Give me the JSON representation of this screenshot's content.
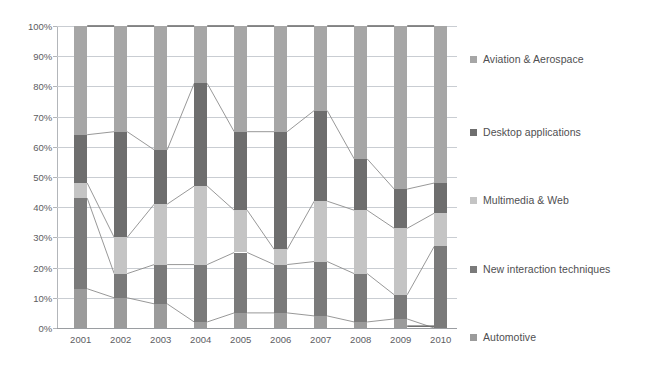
{
  "chart_data": {
    "type": "bar",
    "stacked": true,
    "normalized": true,
    "title": "",
    "xlabel": "",
    "ylabel": "",
    "ylim": [
      0,
      100
    ],
    "grid": true,
    "legend_position": "right",
    "categories": [
      "2001",
      "2002",
      "2003",
      "2004",
      "2005",
      "2006",
      "2007",
      "2008",
      "2009",
      "2010"
    ],
    "ytick_labels": [
      "0%",
      "10%",
      "20%",
      "30%",
      "40%",
      "50%",
      "60%",
      "70%",
      "80%",
      "90%",
      "100%"
    ],
    "ytick_values": [
      0,
      10,
      20,
      30,
      40,
      50,
      60,
      70,
      80,
      90,
      100
    ],
    "series": [
      {
        "name": "Automotive",
        "color": "#9b9b9b",
        "values": [
          13,
          10,
          8,
          2,
          5,
          5,
          4,
          2,
          3,
          0
        ]
      },
      {
        "name": "New interaction techniques",
        "color": "#7a7a7a",
        "values": [
          30,
          8,
          13,
          19,
          20,
          16,
          18,
          16,
          8,
          27
        ]
      },
      {
        "name": "Multimedia & Web",
        "color": "#c4c4c4",
        "values": [
          5,
          12,
          20,
          26,
          14,
          5,
          20,
          21,
          22,
          11
        ]
      },
      {
        "name": "Desktop applications",
        "color": "#6e6e6e",
        "values": [
          16,
          35,
          18,
          34,
          26,
          39,
          30,
          17,
          13,
          10
        ]
      },
      {
        "name": "Aviation & Aerospace",
        "color": "#a6a6a6",
        "values": [
          36,
          35,
          41,
          19,
          35,
          35,
          28,
          44,
          54,
          52
        ]
      }
    ],
    "cumulative_tops": {
      "2001": [
        13,
        43,
        48,
        64,
        100
      ],
      "2002": [
        10,
        18,
        30,
        65,
        100
      ],
      "2003": [
        8,
        21,
        41,
        59,
        100
      ],
      "2004": [
        2,
        21,
        47,
        81,
        100
      ],
      "2005": [
        5,
        25,
        39,
        65,
        100
      ],
      "2006": [
        5,
        21,
        26,
        65,
        100
      ],
      "2007": [
        4,
        22,
        42,
        72,
        100
      ],
      "2008": [
        2,
        18,
        39,
        56,
        100
      ],
      "2009": [
        3,
        11,
        33,
        46,
        100
      ],
      "2010": [
        0,
        27,
        38,
        48,
        100
      ]
    }
  },
  "legend": {
    "items": [
      {
        "label": "Aviation & Aerospace",
        "color": "#a6a6a6",
        "top": 27
      },
      {
        "label": "Desktop applications",
        "color": "#6e6e6e",
        "top": 100
      },
      {
        "label": "Multimedia & Web",
        "color": "#c4c4c4",
        "top": 168
      },
      {
        "label": "New interaction techniques",
        "color": "#7a7a7a",
        "top": 237
      },
      {
        "label": "Automotive",
        "color": "#9b9b9b",
        "top": 305
      }
    ]
  },
  "colors": {
    "background": "#ffffff",
    "gridline": "#c9cdd2",
    "axis": "#b3b6ba",
    "text": "#5d5d5f",
    "connector": "#8c8c8c"
  }
}
